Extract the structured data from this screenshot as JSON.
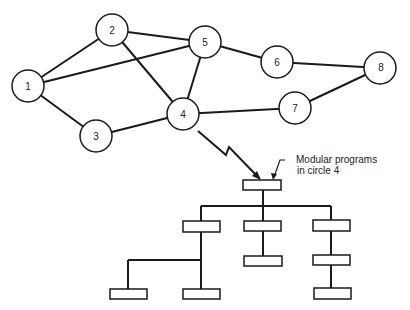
{
  "network": {
    "nodes": [
      {
        "id": "1",
        "label": "1",
        "x": 28,
        "y": 86
      },
      {
        "id": "2",
        "label": "2",
        "x": 112,
        "y": 30
      },
      {
        "id": "3",
        "label": "3",
        "x": 96,
        "y": 136
      },
      {
        "id": "4",
        "label": "4",
        "x": 183,
        "y": 114
      },
      {
        "id": "5",
        "label": "5",
        "x": 205,
        "y": 42
      },
      {
        "id": "6",
        "label": "6",
        "x": 277,
        "y": 62
      },
      {
        "id": "7",
        "label": "7",
        "x": 295,
        "y": 108
      },
      {
        "id": "8",
        "label": "8",
        "x": 380,
        "y": 68
      }
    ],
    "edges": [
      [
        "1",
        "2"
      ],
      [
        "1",
        "5"
      ],
      [
        "1",
        "3"
      ],
      [
        "2",
        "5"
      ],
      [
        "2",
        "4"
      ],
      [
        "5",
        "4"
      ],
      [
        "5",
        "6"
      ],
      [
        "6",
        "8"
      ],
      [
        "3",
        "4"
      ],
      [
        "4",
        "7"
      ],
      [
        "7",
        "8"
      ]
    ]
  },
  "annotation": {
    "line1": "Modular programs",
    "line2": "in circle 4"
  },
  "hierarchy": {
    "root": "module-root",
    "children": [
      {
        "id": "left",
        "children": [
          {
            "id": "left-a"
          },
          {
            "id": "left-b"
          }
        ]
      },
      {
        "id": "middle",
        "children": [
          {
            "id": "middle-a"
          }
        ]
      },
      {
        "id": "right",
        "children": [
          {
            "id": "right-a",
            "children": [
              {
                "id": "right-a-1"
              }
            ]
          }
        ]
      }
    ]
  }
}
